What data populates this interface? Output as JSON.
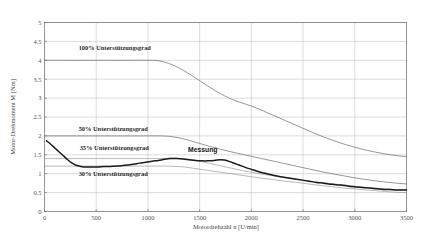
{
  "chart_data": {
    "type": "line",
    "title": "",
    "xlabel": "Motordrehzahl n [U/min]",
    "ylabel": "Motor-Drehmoment M [Nm]",
    "xlim": [
      0,
      3500
    ],
    "ylim": [
      0,
      5
    ],
    "xticks": [
      0,
      500,
      1000,
      1500,
      2000,
      2500,
      3000,
      3500
    ],
    "xtick_labels": [
      "0",
      "500",
      "1000",
      "1500",
      "2000",
      "2500",
      "3000",
      "3500"
    ],
    "yticks": [
      0,
      0.5,
      1,
      1.5,
      2,
      2.5,
      3,
      3.5,
      4,
      4.5,
      5
    ],
    "ytick_labels": [
      "0",
      "0.5",
      "1",
      "1.5",
      "2",
      "2.5",
      "3",
      "3.5",
      "4",
      "4.5",
      "5"
    ],
    "grid": true,
    "legend": "inline-annotations",
    "series": [
      {
        "name": "100% Unterstützungsgrad",
        "label": "100% Unterstützungsgrad",
        "label_x": 330,
        "label_y": 4.28,
        "color": "#6b6b6b",
        "width": 0.7,
        "points": [
          [
            0,
            4.0
          ],
          [
            200,
            4.0
          ],
          [
            400,
            4.0
          ],
          [
            600,
            4.0
          ],
          [
            800,
            4.0
          ],
          [
            1000,
            4.0
          ],
          [
            1100,
            3.99
          ],
          [
            1200,
            3.92
          ],
          [
            1300,
            3.8
          ],
          [
            1400,
            3.64
          ],
          [
            1500,
            3.46
          ],
          [
            1600,
            3.28
          ],
          [
            1700,
            3.12
          ],
          [
            1800,
            2.98
          ],
          [
            1900,
            2.88
          ],
          [
            2000,
            2.79
          ],
          [
            2100,
            2.68
          ],
          [
            2200,
            2.56
          ],
          [
            2300,
            2.44
          ],
          [
            2400,
            2.32
          ],
          [
            2500,
            2.2
          ],
          [
            2600,
            2.08
          ],
          [
            2700,
            1.97
          ],
          [
            2800,
            1.87
          ],
          [
            2900,
            1.78
          ],
          [
            3000,
            1.7
          ],
          [
            3100,
            1.63
          ],
          [
            3200,
            1.57
          ],
          [
            3300,
            1.52
          ],
          [
            3400,
            1.48
          ],
          [
            3500,
            1.45
          ]
        ]
      },
      {
        "name": "50% Unterstützungsgrad",
        "label": "50% Unterstützungsgrad",
        "label_x": 330,
        "label_y": 2.14,
        "color": "#6b6b6b",
        "width": 0.7,
        "points": [
          [
            0,
            2.0
          ],
          [
            300,
            2.0
          ],
          [
            600,
            2.0
          ],
          [
            900,
            2.0
          ],
          [
            1100,
            2.0
          ],
          [
            1200,
            1.99
          ],
          [
            1300,
            1.95
          ],
          [
            1400,
            1.88
          ],
          [
            1500,
            1.8
          ],
          [
            1600,
            1.72
          ],
          [
            1700,
            1.65
          ],
          [
            1800,
            1.58
          ],
          [
            1900,
            1.52
          ],
          [
            2000,
            1.46
          ],
          [
            2100,
            1.4
          ],
          [
            2200,
            1.34
          ],
          [
            2300,
            1.28
          ],
          [
            2400,
            1.22
          ],
          [
            2500,
            1.16
          ],
          [
            2600,
            1.1
          ],
          [
            2700,
            1.04
          ],
          [
            2800,
            0.99
          ],
          [
            2900,
            0.94
          ],
          [
            3000,
            0.89
          ],
          [
            3100,
            0.85
          ],
          [
            3200,
            0.81
          ],
          [
            3300,
            0.78
          ],
          [
            3400,
            0.75
          ],
          [
            3500,
            0.73
          ]
        ]
      },
      {
        "name": "35% Unterstützungsgrad",
        "label": "35% Unterstützungsgrad",
        "label_x": 340,
        "label_y": 1.62,
        "color": "#8a8a8a",
        "width": 0.6,
        "points": [
          [
            0,
            1.4
          ],
          [
            400,
            1.4
          ],
          [
            800,
            1.4
          ],
          [
            1100,
            1.4
          ],
          [
            1250,
            1.41
          ],
          [
            1400,
            1.38
          ],
          [
            1500,
            1.33
          ],
          [
            1600,
            1.27
          ],
          [
            1700,
            1.21
          ],
          [
            1800,
            1.15
          ],
          [
            1900,
            1.09
          ],
          [
            2000,
            1.04
          ],
          [
            2100,
            0.99
          ],
          [
            2200,
            0.95
          ],
          [
            2300,
            0.91
          ],
          [
            2400,
            0.87
          ],
          [
            2500,
            0.83
          ],
          [
            2600,
            0.79
          ],
          [
            2700,
            0.76
          ],
          [
            2800,
            0.73
          ],
          [
            2900,
            0.7
          ],
          [
            3000,
            0.67
          ],
          [
            3100,
            0.64
          ],
          [
            3200,
            0.62
          ],
          [
            3300,
            0.6
          ],
          [
            3400,
            0.58
          ],
          [
            3500,
            0.57
          ]
        ]
      },
      {
        "name": "30% Unterstützungsgrad",
        "label": "30% Unterstützungsgrad",
        "label_x": 330,
        "label_y": 0.93,
        "color": "#8a8a8a",
        "width": 0.6,
        "points": [
          [
            0,
            1.2
          ],
          [
            400,
            1.2
          ],
          [
            800,
            1.2
          ],
          [
            1100,
            1.2
          ],
          [
            1200,
            1.2
          ],
          [
            1300,
            1.19
          ],
          [
            1400,
            1.16
          ],
          [
            1500,
            1.12
          ],
          [
            1600,
            1.08
          ],
          [
            1700,
            1.04
          ],
          [
            1800,
            1.0
          ],
          [
            1900,
            0.96
          ],
          [
            2000,
            0.92
          ],
          [
            2100,
            0.88
          ],
          [
            2200,
            0.85
          ],
          [
            2300,
            0.81
          ],
          [
            2400,
            0.78
          ],
          [
            2500,
            0.75
          ],
          [
            2600,
            0.71
          ],
          [
            2700,
            0.68
          ],
          [
            2800,
            0.65
          ],
          [
            2900,
            0.62
          ],
          [
            3000,
            0.6
          ],
          [
            3100,
            0.57
          ],
          [
            3200,
            0.55
          ],
          [
            3300,
            0.53
          ],
          [
            3400,
            0.51
          ],
          [
            3500,
            0.5
          ]
        ]
      },
      {
        "name": "Messung",
        "label": "Messung",
        "label_x": 1530,
        "label_y": 1.58,
        "color": "#1a1a1a",
        "width": 1.5,
        "points": [
          [
            20,
            1.87
          ],
          [
            60,
            1.78
          ],
          [
            100,
            1.68
          ],
          [
            140,
            1.58
          ],
          [
            180,
            1.48
          ],
          [
            220,
            1.38
          ],
          [
            260,
            1.29
          ],
          [
            300,
            1.23
          ],
          [
            340,
            1.2
          ],
          [
            380,
            1.18
          ],
          [
            420,
            1.18
          ],
          [
            470,
            1.18
          ],
          [
            520,
            1.18
          ],
          [
            570,
            1.19
          ],
          [
            620,
            1.19
          ],
          [
            680,
            1.2
          ],
          [
            740,
            1.21
          ],
          [
            800,
            1.23
          ],
          [
            860,
            1.25
          ],
          [
            920,
            1.28
          ],
          [
            980,
            1.3
          ],
          [
            1040,
            1.33
          ],
          [
            1100,
            1.35
          ],
          [
            1160,
            1.38
          ],
          [
            1220,
            1.4
          ],
          [
            1280,
            1.4
          ],
          [
            1340,
            1.39
          ],
          [
            1400,
            1.37
          ],
          [
            1460,
            1.35
          ],
          [
            1520,
            1.34
          ],
          [
            1580,
            1.34
          ],
          [
            1640,
            1.35
          ],
          [
            1700,
            1.37
          ],
          [
            1740,
            1.36
          ],
          [
            1790,
            1.32
          ],
          [
            1850,
            1.26
          ],
          [
            1910,
            1.2
          ],
          [
            1970,
            1.14
          ],
          [
            2030,
            1.09
          ],
          [
            2090,
            1.04
          ],
          [
            2150,
            1.0
          ],
          [
            2210,
            0.96
          ],
          [
            2280,
            0.92
          ],
          [
            2350,
            0.89
          ],
          [
            2420,
            0.86
          ],
          [
            2490,
            0.83
          ],
          [
            2560,
            0.8
          ],
          [
            2630,
            0.77
          ],
          [
            2700,
            0.75
          ],
          [
            2780,
            0.72
          ],
          [
            2860,
            0.7
          ],
          [
            2940,
            0.67
          ],
          [
            3020,
            0.65
          ],
          [
            3100,
            0.63
          ],
          [
            3180,
            0.61
          ],
          [
            3260,
            0.59
          ],
          [
            3340,
            0.58
          ],
          [
            3420,
            0.57
          ],
          [
            3500,
            0.57
          ]
        ]
      }
    ]
  },
  "colors": {
    "grid": "#b8b8b8",
    "frame": "#7a7a7a",
    "text": "#444444",
    "measurement": "#1a1a1a"
  }
}
